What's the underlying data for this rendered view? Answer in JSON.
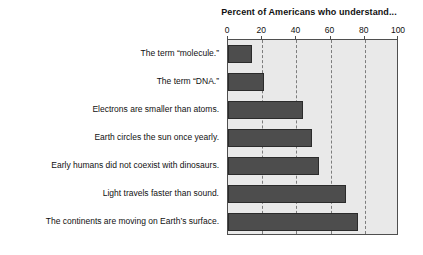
{
  "chart_data": {
    "type": "bar",
    "orientation": "horizontal",
    "title": "Percent of Americans who understand...",
    "xlabel": "",
    "ylabel": "",
    "xlim": [
      0,
      100
    ],
    "xticks": [
      0,
      20,
      40,
      60,
      80,
      100
    ],
    "xtick_labels": [
      "0",
      "20",
      "40",
      "60",
      "80",
      "100"
    ],
    "grid": true,
    "grid_axis": "x",
    "grid_style": "dashed",
    "legend": false,
    "categories": [
      "The term “molecule.”",
      "The term “DNA.”",
      "Electrons are smaller than atoms.",
      "Earth circles the sun once yearly.",
      "Early humans did not coexist with dinosaurs.",
      "Light travels faster than sound.",
      "The continents are moving on Earth’s surface."
    ],
    "values": [
      14,
      21,
      44,
      49,
      53,
      69,
      76
    ],
    "bar_color": "#4d4d4d",
    "bar_border_color": "#2b2b2b",
    "plot_background": "#e9e9e9",
    "axis_color": "#4f4f4f",
    "gridline_color": "#7d7d7d",
    "text_color": "#111111"
  }
}
